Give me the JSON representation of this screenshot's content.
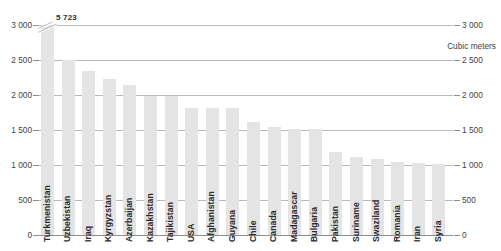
{
  "chart_data": {
    "type": "bar",
    "title": "",
    "subtitle": "",
    "xlabel": "",
    "ylabel": "Cubic meters",
    "unit_label": "Cubic meters",
    "ylim": [
      0,
      3000
    ],
    "yticks": [
      0,
      500,
      1000,
      1500,
      2000,
      2500,
      3000
    ],
    "ytick_labels": [
      "0",
      "500",
      "1 000",
      "1 500",
      "2 000",
      "2 500",
      "3 000"
    ],
    "grid": true,
    "legend": "none",
    "axis_left": true,
    "axis_right": true,
    "bar_color": "#e4e4e4",
    "grid_color": "#b9b9b9",
    "categories": [
      "Turkmenistan",
      "Uzbekistan",
      "Iraq",
      "Kyrgyzstan",
      "Azerbaijan",
      "Kazakhstan",
      "Tajikistan",
      "USA",
      "Afghanistan",
      "Guyana",
      "Chile",
      "Canada",
      "Madagascar",
      "Bulgaria",
      "Pakistan",
      "Suriname",
      "Swaziland",
      "Romania",
      "Iran",
      "Syria"
    ],
    "values": [
      5723,
      2500,
      2350,
      2230,
      2150,
      1990,
      1980,
      1820,
      1820,
      1820,
      1610,
      1540,
      1510,
      1510,
      1190,
      1120,
      1080,
      1045,
      1030,
      1020
    ],
    "value_labels": [
      "5 723",
      "",
      "",
      "",
      "",
      "",
      "",
      "",
      "",
      "",
      "",
      "",
      "",
      "",
      "",
      "",
      "",
      "",
      "",
      ""
    ],
    "broken_bars": [
      0
    ],
    "annotations": [
      {
        "text": "5 723",
        "target": "Turkmenistan",
        "note": "axis-break label above truncated bar"
      }
    ]
  }
}
